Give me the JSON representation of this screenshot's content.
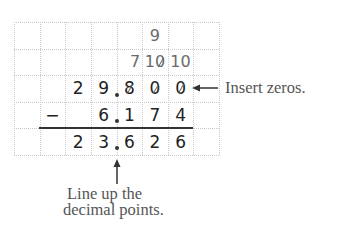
{
  "figure": {
    "grid": {
      "columns": 8,
      "rows": 5
    },
    "rows": [
      {
        "role": "borrow-top",
        "cells": [
          {
            "col": 5,
            "text": "9",
            "style": "gray"
          }
        ]
      },
      {
        "role": "borrow",
        "cells": [
          {
            "col": 4,
            "text": "7",
            "style": "gray"
          },
          {
            "col": 5,
            "text": "10",
            "style": "gray",
            "crossed_digit": "0"
          },
          {
            "col": 6,
            "text": "10",
            "style": "gray"
          }
        ]
      },
      {
        "role": "minuend",
        "cells": [
          {
            "col": 2,
            "text": "2"
          },
          {
            "col": 3,
            "text": "9"
          },
          {
            "col": 4,
            "text": "8",
            "crossed": true
          },
          {
            "col": 5,
            "text": "0",
            "crossed": true
          },
          {
            "col": 6,
            "text": "0",
            "crossed": true
          }
        ]
      },
      {
        "role": "subtrahend",
        "cells": [
          {
            "col": 1,
            "text": "−"
          },
          {
            "col": 3,
            "text": "6"
          },
          {
            "col": 4,
            "text": "1"
          },
          {
            "col": 5,
            "text": "7"
          },
          {
            "col": 6,
            "text": "4"
          }
        ]
      },
      {
        "role": "difference",
        "cells": [
          {
            "col": 2,
            "text": "2"
          },
          {
            "col": 3,
            "text": "3"
          },
          {
            "col": 4,
            "text": "6"
          },
          {
            "col": 5,
            "text": "2"
          },
          {
            "col": 6,
            "text": "6"
          }
        ]
      }
    ],
    "minuend_value": "29.800",
    "subtrahend_value": "6.174",
    "difference_value": "23.626",
    "annotations": {
      "insert_zeros": "Insert zeros.",
      "line_up_line1": "Line up the",
      "line_up_line2": "decimal points."
    }
  }
}
